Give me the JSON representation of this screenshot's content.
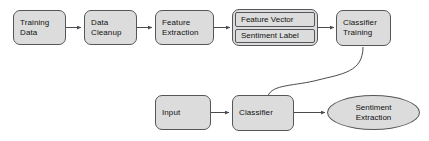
{
  "diagram": {
    "colors": {
      "node_fill": "#dcdcdc",
      "node_border": "#55565a",
      "edge": "#4a4b4f",
      "text": "#111111",
      "background": "#ffffff"
    },
    "training_row": {
      "training_data": {
        "line1": "Training",
        "line2": "Data"
      },
      "data_cleanup": {
        "line1": "Data",
        "line2": "Cleanup"
      },
      "feature_extraction": {
        "line1": "Feature",
        "line2": "Extraction"
      },
      "feature_vector_label": {
        "compartment1": "Feature Vector",
        "compartment2": "Sentiment Label"
      },
      "classifier_training": {
        "line1": "Classifier",
        "line2": "Training"
      }
    },
    "inference_row": {
      "input": {
        "line1": "Input"
      },
      "classifier": {
        "line1": "Classifier"
      },
      "sentiment_extraction": {
        "line1": "Sentiment",
        "line2": "Extraction"
      }
    }
  }
}
